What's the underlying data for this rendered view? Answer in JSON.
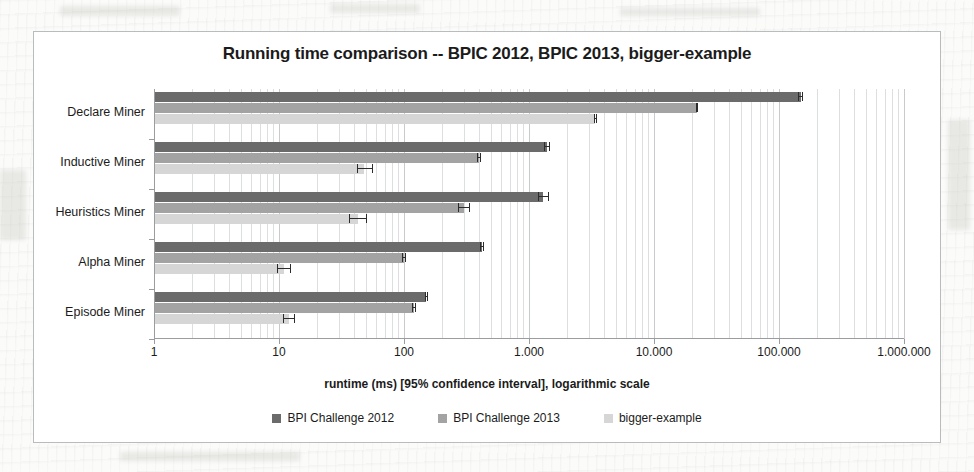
{
  "chart_data": {
    "type": "bar",
    "orientation": "horizontal",
    "title": "Running time comparison -- BPIC 2012, BPIC 2013, bigger-example",
    "xlabel": "runtime (ms) [95% confidence interval], logarithmic scale",
    "ylabel": "",
    "scale": "log",
    "grid": true,
    "legend_position": "bottom",
    "xlim": [
      1,
      1000000
    ],
    "xticks": [
      1,
      10,
      100,
      1000,
      10000,
      100000,
      1000000
    ],
    "xtick_labels": [
      "1",
      "10",
      "100",
      "1.000",
      "10.000",
      "100.000",
      "1.000.000"
    ],
    "categories": [
      "Declare Miner",
      "Inductive Miner",
      "Heuristics Miner",
      "Alpha Miner",
      "Episode Miner"
    ],
    "series": [
      {
        "name": "BPI Challenge 2012",
        "color": "#6b6b6b",
        "values": [
          150000,
          1400,
          1300,
          420,
          150
        ],
        "ci_low": [
          143000,
          1330,
          1180,
          405,
          146
        ],
        "ci_high": [
          157000,
          1470,
          1450,
          435,
          155
        ]
      },
      {
        "name": "BPI Challenge 2013",
        "color": "#a3a3a3",
        "values": [
          22000,
          400,
          300,
          100,
          120
        ],
        "ci_low": [
          21500,
          385,
          270,
          97,
          116
        ],
        "ci_high": [
          22600,
          415,
          335,
          103,
          124
        ]
      },
      {
        "name": "bigger-example",
        "color": "#d6d6d6",
        "values": [
          3400,
          48,
          43,
          11,
          12
        ],
        "ci_low": [
          3330,
          42,
          36,
          9.6,
          10.8
        ],
        "ci_high": [
          3470,
          56,
          51,
          12.5,
          13.4
        ]
      }
    ]
  },
  "legend": {
    "items": [
      {
        "label": "BPI Challenge 2012",
        "color": "#6b6b6b"
      },
      {
        "label": "BPI Challenge 2013",
        "color": "#a3a3a3"
      },
      {
        "label": "bigger-example",
        "color": "#d6d6d6"
      }
    ]
  }
}
